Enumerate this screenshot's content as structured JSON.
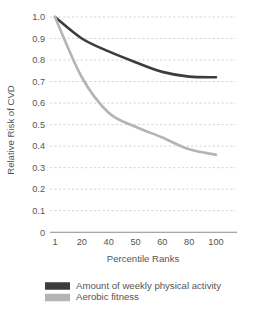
{
  "chart_data": {
    "type": "line",
    "title": "",
    "xlabel": "Percentile Ranks",
    "ylabel": "Relative Risk of CVD",
    "x": [
      1,
      20,
      40,
      50,
      60,
      80,
      100
    ],
    "xtick_labels": [
      "1",
      "20",
      "40",
      "50",
      "60",
      "80",
      "100"
    ],
    "ytick_labels": [
      "0",
      "0.1",
      "0.2",
      "0.3",
      "0.4",
      "0.5",
      "0.6",
      "0.7",
      "0.8",
      "0.9",
      "1.0"
    ],
    "ylim": [
      0,
      1.0
    ],
    "grid": "horizontal-dotted",
    "legend_position": "bottom-left",
    "series": [
      {
        "name": "Amount of weekly physical activity",
        "color": "#3c3c3c",
        "values": [
          1.0,
          0.9,
          0.84,
          0.79,
          0.745,
          0.723,
          0.72
        ]
      },
      {
        "name": "Aerobic fitness",
        "color": "#b4b4b4",
        "values": [
          1.0,
          0.72,
          0.555,
          0.49,
          0.44,
          0.385,
          0.36
        ]
      }
    ]
  },
  "legend": {
    "items": [
      {
        "label": "Amount of weekly physical activity",
        "color": "#3c3c3c"
      },
      {
        "label": "Aerobic fitness",
        "color": "#b4b4b4"
      }
    ]
  },
  "axes": {
    "x_title": "Percentile Ranks",
    "y_title": "Relative Risk of CVD"
  }
}
